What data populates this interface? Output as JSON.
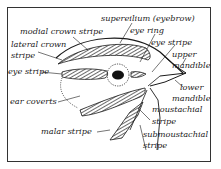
{
  "diagram": {
    "labels": {
      "supercilium": "supereilium (eyebrow)",
      "medial_crown_stripe": "modial crown stripe",
      "lateral_crown_stripe_1": "lateral crown",
      "lateral_crown_stripe_2": "stripe",
      "eye_ring": "eye ring",
      "eye_stripe_left": "eye stripe",
      "eye_stripe_right": "eye stripe",
      "upper_mandible_1": "upper",
      "upper_mandible_2": "mandible",
      "lower_mandible_1": "lower",
      "lower_mandible_2": "mandible",
      "ear_coverts": "ear coverts",
      "moustachial_stripe_1": "moustachial",
      "moustachial_stripe_2": "stripe",
      "malar_stripe": "malar stripe",
      "submoustachial_stripe_1": "submoustachial",
      "submoustachial_stripe_2": "stripe"
    },
    "colors": {
      "ink": "#1a1a1a",
      "background": "#ffffff"
    }
  }
}
